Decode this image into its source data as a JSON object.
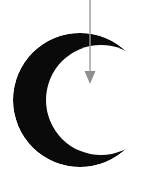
{
  "figure": {
    "title": "crescent-with-downward-arrow",
    "canvas": {
      "width": 159,
      "height": 182,
      "background_color": "#ffffff"
    },
    "shapes": {
      "crescent": {
        "name": "crescent-moon",
        "fill_color": "#0a0a0a",
        "opening_direction": "right",
        "outer_circle": {
          "cx": 80,
          "cy": 100,
          "r": 67
        },
        "inner_circle": {
          "cx": 101,
          "cy": 100,
          "r": 55
        },
        "bounds": {
          "left": 13,
          "top": 33,
          "right": 146,
          "bottom": 167
        }
      },
      "arrow": {
        "name": "downward-arrow",
        "stroke_color": "#9a9a9a",
        "head_fill_color": "#8f8f8f",
        "stroke_width": 1.4,
        "direction": "down",
        "x": 90,
        "start_y": 0,
        "end_y": 84,
        "head_width": 11,
        "head_height": 13
      }
    }
  }
}
